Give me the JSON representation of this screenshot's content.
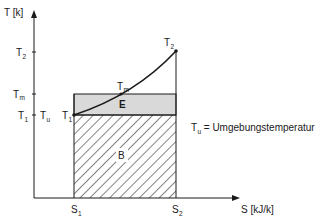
{
  "diagram": {
    "type": "T-S diagram (temperature-entropy)",
    "axes": {
      "y_label": "T [k]",
      "x_label": "S [kJ/k]"
    },
    "y_ticks": [
      {
        "main": "T",
        "sub": "2"
      },
      {
        "main": "T",
        "sub": "m"
      },
      {
        "main": "T",
        "sub": "1"
      }
    ],
    "y_tick_extra": {
      "main": "T",
      "sub": "u"
    },
    "x_ticks": [
      {
        "main": "S",
        "sub": "1"
      },
      {
        "main": "S",
        "sub": "2"
      }
    ],
    "points": [
      {
        "main": "T",
        "sub": "1"
      },
      {
        "main": "T",
        "sub": "m"
      },
      {
        "main": "T",
        "sub": "2"
      }
    ],
    "regions": {
      "E": "E",
      "B": "B"
    },
    "legend": {
      "main": "T",
      "sub": "u",
      "text": " = Umgebungstemperatur"
    },
    "colors": {
      "line": "#1a1a1a",
      "region_E_fill": "#d9d9d9",
      "hatch": "#1a1a1a"
    }
  }
}
